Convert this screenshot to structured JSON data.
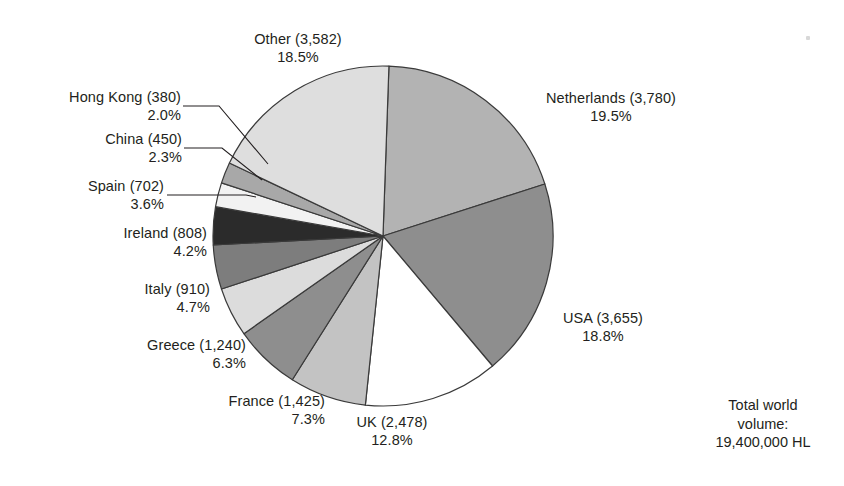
{
  "chart_data": {
    "type": "pie",
    "title": "",
    "subtitle": "",
    "units": "thousand HL",
    "total_label_lines": [
      "Total world",
      "volume:",
      "19,400,000 HL"
    ],
    "total_value": "19,400,000 HL",
    "legend_position": "callout-labels",
    "grid": false,
    "categories": [
      "Netherlands",
      "USA",
      "UK",
      "France",
      "Greece",
      "Italy",
      "Ireland",
      "Spain",
      "China",
      "Hong Kong",
      "Other"
    ],
    "values": [
      3780,
      3655,
      2478,
      1425,
      1240,
      910,
      808,
      702,
      450,
      380,
      3582
    ],
    "percents": [
      19.5,
      18.8,
      12.8,
      7.3,
      6.3,
      4.7,
      4.2,
      3.6,
      2.3,
      2.0,
      18.5
    ],
    "slices": [
      {
        "name": "Netherlands",
        "value": 3780,
        "value_text": "3,780",
        "percent": 19.5,
        "percent_text": "19.5%",
        "label": "Netherlands (3,780)",
        "color": "#b3b3b3"
      },
      {
        "name": "USA",
        "value": 3655,
        "value_text": "3,655",
        "percent": 18.8,
        "percent_text": "18.8%",
        "label": "USA (3,655)",
        "color": "#8e8e8e"
      },
      {
        "name": "UK",
        "value": 2478,
        "value_text": "2,478",
        "percent": 12.8,
        "percent_text": "12.8%",
        "label": "UK (2,478)",
        "color": "#ffffff"
      },
      {
        "name": "France",
        "value": 1425,
        "value_text": "1,425",
        "percent": 7.3,
        "percent_text": "7.3%",
        "label": "France (1,425)",
        "color": "#c3c3c3"
      },
      {
        "name": "Greece",
        "value": 1240,
        "value_text": "1,240",
        "percent": 6.3,
        "percent_text": "6.3%",
        "label": "Greece (1,240)",
        "color": "#8e8e8e"
      },
      {
        "name": "Italy",
        "value": 910,
        "value_text": "910",
        "percent": 4.7,
        "percent_text": "4.7%",
        "label": "Italy (910)",
        "color": "#dcdcdc"
      },
      {
        "name": "Ireland",
        "value": 808,
        "value_text": "808",
        "percent": 4.2,
        "percent_text": "4.2%",
        "label": "Ireland (808)",
        "color": "#7d7d7d"
      },
      {
        "name": "Spain",
        "value": 702,
        "value_text": "702",
        "percent": 3.6,
        "percent_text": "3.6%",
        "label": "Spain (702)",
        "color": "#2b2b2b"
      },
      {
        "name": "China",
        "value": 450,
        "value_text": "450",
        "percent": 2.3,
        "percent_text": "2.3%",
        "label": "China (450)",
        "color": "#f2f2f2"
      },
      {
        "name": "Hong Kong",
        "value": 380,
        "value_text": "380",
        "percent": 2.0,
        "percent_text": "2.0%",
        "label": "Hong Kong (380)",
        "color": "#a8a8a8"
      },
      {
        "name": "Other",
        "value": 3582,
        "value_text": "3,582",
        "percent": 18.5,
        "percent_text": "18.5%",
        "label": "Other (3,582)",
        "color": "#dedede"
      }
    ],
    "stroke_color": "#3a3a3a"
  },
  "labels": {
    "other": {
      "line1": "Other (3,582)",
      "line2": "18.5%"
    },
    "hong_kong": {
      "line1": "Hong Kong (380)",
      "line2": "2.0%"
    },
    "china": {
      "line1": "China (450)",
      "line2": "2.3%"
    },
    "spain": {
      "line1": "Spain (702)",
      "line2": "3.6%"
    },
    "ireland": {
      "line1": "Ireland (808)",
      "line2": "4.2%"
    },
    "italy": {
      "line1": "Italy (910)",
      "line2": "4.7%"
    },
    "greece": {
      "line1": "Greece (1,240)",
      "line2": "6.3%"
    },
    "france": {
      "line1": "France (1,425)",
      "line2": "7.3%"
    },
    "uk": {
      "line1": "UK (2,478)",
      "line2": "12.8%"
    },
    "usa": {
      "line1": "USA (3,655)",
      "line2": "18.8%"
    },
    "netherlands": {
      "line1": "Netherlands (3,780)",
      "line2": "19.5%"
    }
  },
  "total": {
    "line1": "Total world",
    "line2": "volume:",
    "line3": "19,400,000 HL"
  }
}
